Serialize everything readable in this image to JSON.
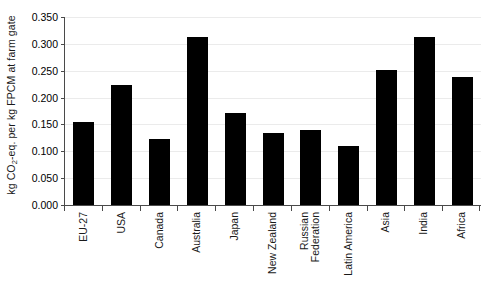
{
  "chart_data": {
    "type": "bar",
    "title": "",
    "subtitle": "",
    "xlabel": "",
    "ylabel": "kg CO2-eq. per kg FPCM at farm gate",
    "ylabel_parts": {
      "pre": "kg CO",
      "sub": "2",
      "post": "-eq. per kg FPCM at farm gate"
    },
    "categories": [
      "EU-27",
      "USA",
      "Canada",
      "Australia",
      "Japan",
      "New Zealand",
      "Russian Federation",
      "Latin America",
      "Asia",
      "India",
      "Africa"
    ],
    "category_lines": [
      [
        "EU-27"
      ],
      [
        "USA"
      ],
      [
        "Canada"
      ],
      [
        "Australia"
      ],
      [
        "Japan"
      ],
      [
        "New Zealand"
      ],
      [
        "Russian",
        "Federation"
      ],
      [
        "Latin America"
      ],
      [
        "Asia"
      ],
      [
        "India"
      ],
      [
        "Africa"
      ]
    ],
    "values": [
      0.155,
      0.224,
      0.122,
      0.312,
      0.172,
      0.134,
      0.14,
      0.11,
      0.252,
      0.313,
      0.238
    ],
    "ylim": [
      0.0,
      0.35
    ],
    "yticks": [
      0.0,
      0.05,
      0.1,
      0.15,
      0.2,
      0.25,
      0.3,
      0.35
    ],
    "ytick_labels": [
      "0.000",
      "0.050",
      "0.100",
      "0.150",
      "0.200",
      "0.250",
      "0.300",
      "0.350"
    ],
    "grid": true,
    "grid_axis": "y",
    "legend": false,
    "legend_position": "none",
    "bar_color": "#000000",
    "grid_color": "#ebebeb",
    "axis_color": "#4a4a4a",
    "background_color": "#ffffff"
  }
}
